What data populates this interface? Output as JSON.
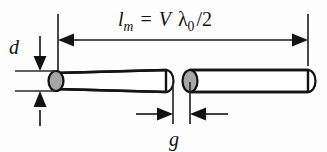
{
  "figure": {
    "background_color": "#fdfdfd",
    "line_color": "#141414",
    "cap_fill_gray": "#a6a6a6",
    "cap_fill_white": "#ffffff"
  },
  "labels": {
    "length_symbol": "l",
    "length_subscript": "m",
    "equals": "=",
    "velocity_symbol": "V",
    "lambda_symbol": "λ",
    "lambda_subscript": "0",
    "divider": "/2",
    "length_full": "l_m = V λ_0 /2",
    "diameter_symbol": "d",
    "gap_symbol": "g"
  },
  "dimensions": {
    "length_dimension_name": "l_m",
    "diameter_dimension_name": "d",
    "gap_dimension_name": "g"
  },
  "elements": {
    "left_rod_name": "left-dipole-arm",
    "right_rod_name": "right-dipole-arm",
    "left_cap_name": "left-arm-near-end-cap",
    "left_far_cap_name": "left-arm-far-end-cap",
    "right_cap_name": "right-arm-near-end-cap",
    "right_far_cap_name": "right-arm-far-end-cap"
  }
}
